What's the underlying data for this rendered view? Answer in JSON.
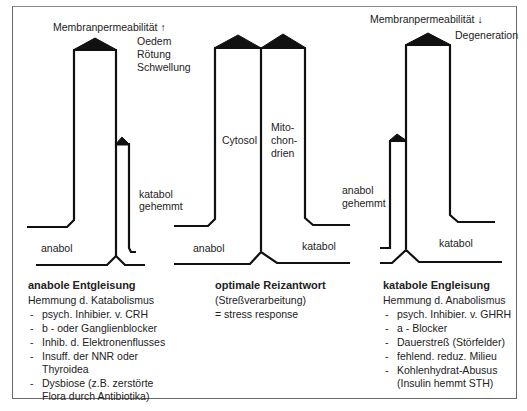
{
  "diagrams": {
    "left": {
      "top_label": "Membranpermeabilität ↑",
      "symptoms": [
        "Oedem",
        "Rötung",
        "Schwellung"
      ],
      "small_column_label": [
        "katabol",
        "gehemmt"
      ],
      "foot_label": "anabol",
      "caption": {
        "title": "anabole Entgleisung",
        "subtitle": "Hemmung d. Katabolismus",
        "items": [
          "psych. Inhibier. v. CRH",
          "b - oder Ganglienblocker",
          "Inhib. d. Elektronenflusses",
          "Insuff. der NNR oder Thyroidea",
          "Dysbiose (z.B. zerstörte Flora durch Antibiotika)"
        ]
      }
    },
    "middle": {
      "left_column_label": "Cytosol",
      "right_column_label": [
        "Mito-",
        "chon-",
        "drien"
      ],
      "left_foot_label": "anabol",
      "right_foot_label": "katabol",
      "caption": {
        "title": "optimale Reizantwort",
        "lines": [
          "(Streßverarbeitung)",
          "= stress response"
        ]
      }
    },
    "right": {
      "top_label": "Membranpermeabilität ↓",
      "symptoms": [
        "Degeneration"
      ],
      "small_column_label": [
        "anabol",
        "gehemmt"
      ],
      "foot_label": "katabol",
      "caption": {
        "title": "katabole Engleisung",
        "subtitle": "Hemmung d. Anabolismus",
        "items": [
          "psych. Inhibier. v. GHRH",
          "a - Blocker",
          "Dauerstreß (Störfelder)",
          "fehlend. reduz. Milieu",
          "Kohlenhydrat-Abusus (Insulin hemmt STH)"
        ]
      }
    }
  },
  "list_marker": "-",
  "colors": {
    "line": "#111111",
    "frame": "#6a6a6a",
    "text": "#222222"
  }
}
